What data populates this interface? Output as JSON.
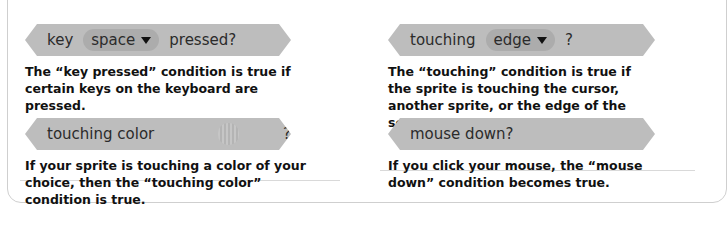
{
  "blocks": [
    {
      "id": "key-pressed",
      "prefix": "key",
      "dropdown": "space",
      "suffix": "pressed?",
      "description": "The “key pressed” condition is true if certain keys on the keyboard are pressed."
    },
    {
      "id": "touching",
      "prefix": "touching",
      "dropdown": "edge",
      "suffix": "?",
      "description": "The “touching” condition is true if the sprite is touching the cursor, another sprite, or the edge of the screen."
    },
    {
      "id": "touching-color",
      "prefix": "touching color",
      "suffix": "?",
      "description": "If your sprite is touching a color of your choice, then the “touching color” condition is true."
    },
    {
      "id": "mouse-down",
      "prefix": "mouse down?",
      "description": "If you click your mouse, the “mouse down” condition becomes true."
    }
  ],
  "colors": {
    "block": "#bdbdbd",
    "dropdown": "#acacac",
    "text": "#111111"
  }
}
